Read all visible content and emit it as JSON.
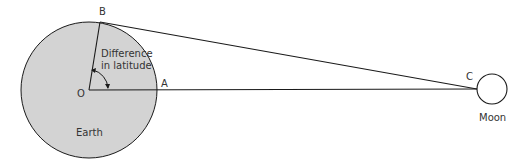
{
  "diagram": {
    "labels": {
      "B": "B",
      "A": "A",
      "C": "C",
      "O": "O",
      "earth": "Earth",
      "moon": "Moon",
      "angle_line1": "Difference",
      "angle_line2": "in latitude"
    },
    "colors": {
      "earth_fill": "#d3d3d3",
      "stroke": "#1a1a1a",
      "moon_fill": "#ffffff",
      "text": "#333333"
    }
  }
}
